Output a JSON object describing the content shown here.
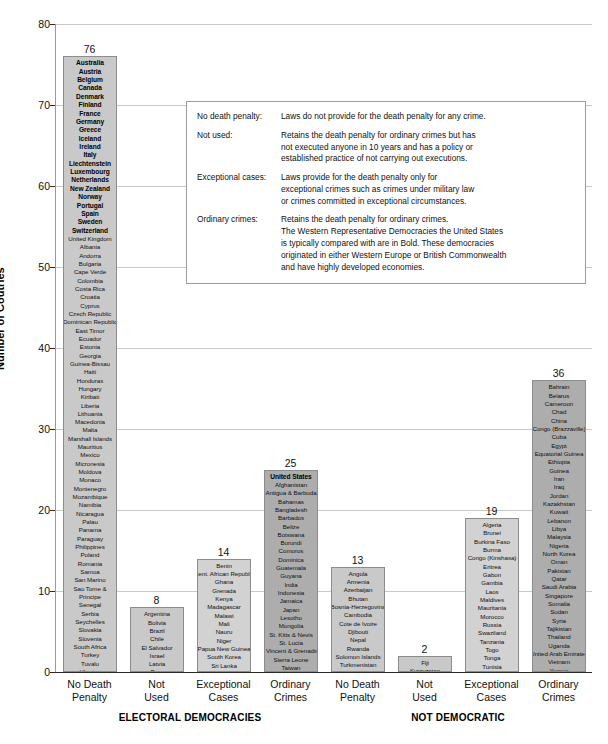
{
  "chart_data": {
    "type": "bar",
    "title": "",
    "xlabel": "",
    "ylabel": "Number of Coutries",
    "ylim": [
      0,
      80
    ],
    "ytick_step": 10,
    "yticks": [
      "0",
      "10",
      "20",
      "30",
      "40",
      "50",
      "60",
      "70",
      "80"
    ],
    "grid": true,
    "legend_position": "inside-upper-right",
    "groups": [
      {
        "name": "ELECTORAL DEMOCRACIES",
        "bars": [
          0,
          1,
          2,
          3
        ]
      },
      {
        "name": "NOT DEMOCRATIC",
        "bars": [
          4,
          5,
          6,
          7
        ]
      }
    ],
    "categories": [
      "No Death Penalty",
      "Not Used",
      "Exceptional Cases",
      "Ordinary Crimes",
      "No Death Penalty",
      "Not Used",
      "Exceptional Cases",
      "Ordinary Crimes"
    ],
    "values": [
      76,
      8,
      14,
      25,
      13,
      2,
      19,
      36
    ],
    "bars": [
      {
        "label_line1": "No Death",
        "label_line2": "Penalty",
        "value": 76,
        "shade": "#c9c9c9",
        "bold_count": 21,
        "countries": [
          "Australia",
          "Austria",
          "Belgium",
          "Canada",
          "Denmark",
          "Finland",
          "France",
          "Germany",
          "Greece",
          "Iceland",
          "Ireland",
          "Italy",
          "Liechtenstein",
          "Luxembourg",
          "Netherlands",
          "New Zealand",
          "Norway",
          "Portugal",
          "Spain",
          "Sweden",
          "Switzerland",
          "United Kingdom",
          "Albania",
          "Andorra",
          "Bulgaria",
          "Cape Verde",
          "Colombia",
          "Costa Rica",
          "Croatia",
          "Cyprus",
          "Czech Republic",
          "Dominican Republic",
          "East Timor",
          "Ecuador",
          "Estonia",
          "Georgia",
          "Guinea-Bissau",
          "Haiti",
          "Honduras",
          "Hungary",
          "Kiribati",
          "Liberia",
          "Lithuania",
          "Macedonia",
          "Malta",
          "Marshall Islands",
          "Mauritius",
          "Mexico",
          "Micronesia",
          "Moldova",
          "Monaco",
          "Montenegro",
          "Mozambique",
          "Namibia",
          "Nicaragua",
          "Palau",
          "Panama",
          "Paraguay",
          "Philippines",
          "Poland",
          "Romania",
          "Samoa",
          "San Marino",
          "Sao Tome &",
          "Principe",
          "Senegal",
          "Serbia",
          "Seychelles",
          "Slovakia",
          "Slovenia",
          "South Africa",
          "Turkey",
          "Tuvalu",
          "Ukraine",
          "Uruguay",
          "Vanuatu",
          "Venezuela"
        ]
      },
      {
        "label_line1": "Not",
        "label_line2": "Used",
        "value": 8,
        "shade": "#c9c9c9",
        "bold_count": 0,
        "countries": [
          "Argentina",
          "Bolivia",
          "Brazil",
          "Chile",
          "El Salvador",
          "Israel",
          "Latvia",
          "Peru"
        ]
      },
      {
        "label_line1": "Exceptional",
        "label_line2": "Cases",
        "value": 14,
        "shade": "#d2d2d2",
        "bold_count": 0,
        "countries": [
          "Benin",
          "Cent. African Republic",
          "Ghana",
          "Grenada",
          "Kenya",
          "Madagascar",
          "Malawi",
          "Mali",
          "Nauru",
          "Niger",
          "Papua New Guinea",
          "South Korea",
          "Sri Lanka",
          "Suriname"
        ]
      },
      {
        "label_line1": "Ordinary",
        "label_line2": "Crimes",
        "value": 25,
        "shade": "#adadad",
        "bold_count": 1,
        "countries": [
          "United States",
          "Afghanistan",
          "Antigua & Barbuda",
          "Bahamas",
          "Bangladesh",
          "Barbados",
          "Belize",
          "Botswana",
          "Burundi",
          "Comoros",
          "Dominica",
          "Guatemala",
          "Guyana",
          "India",
          "Indonesia",
          "Jamaica",
          "Japan",
          "Lesotho",
          "Mongolia",
          "St. Kitts & Nevis",
          "St. Lucia",
          "St. Vincent & Grenadines",
          "Sierra Leone",
          "Taiwan",
          "Trinidad & Tobago"
        ]
      },
      {
        "label_line1": "No Death",
        "label_line2": "Penalty",
        "value": 13,
        "shade": "#c9c9c9",
        "bold_count": 0,
        "countries": [
          "Angola",
          "Armenia",
          "Azerbaijan",
          "Bhutan",
          "Bosnia-Herzegovina",
          "Cambodia",
          "Cote de Ivoire",
          "Djibouti",
          "Nepal",
          "Rwanda",
          "Solomon Islands",
          "Turkmenistan",
          "Uzbekistan"
        ]
      },
      {
        "label_line1": "Not",
        "label_line2": "Used",
        "value": 2,
        "shade": "#c9c9c9",
        "bold_count": 0,
        "countries": [
          "Fiji",
          "Kyrgyzstan"
        ]
      },
      {
        "label_line1": "Exceptional",
        "label_line2": "Cases",
        "value": 19,
        "shade": "#d2d2d2",
        "bold_count": 0,
        "countries": [
          "Algeria",
          "Brunei",
          "Burkina Faso",
          "Burma",
          "Congo (Kinshasa)",
          "Eritrea",
          "Gabon",
          "Gambia",
          "Laos",
          "Maldives",
          "Mauritania",
          "Morocco",
          "Russia",
          "Swaziland",
          "Tanzania",
          "Togo",
          "Tonga",
          "Tunisia",
          "Zambia"
        ]
      },
      {
        "label_line1": "Ordinary",
        "label_line2": "Crimes",
        "value": 36,
        "shade": "#adadad",
        "bold_count": 0,
        "countries": [
          "Bahrain",
          "Belarus",
          "Cameroon",
          "Chad",
          "China",
          "Congo (Brazzaville)",
          "Cuba",
          "Egypt",
          "Equatorial Guinea",
          "Ethiopia",
          "Guinea",
          "Iran",
          "Iraq",
          "Jordan",
          "Kazakhstan",
          "Kuwait",
          "Lebanon",
          "Libya",
          "Malaysia",
          "Nigeria",
          "North Korea",
          "Oman",
          "Pakistan",
          "Qatar",
          "Saudi Arabia",
          "Singapore",
          "Somalia",
          "Sudan",
          "Syria",
          "Tajikistan",
          "Thailand",
          "Uganda",
          "United Arab Emirates",
          "Vietnam",
          "Yemen",
          "Zimbabwe"
        ]
      }
    ]
  },
  "legend": {
    "rows": [
      {
        "term": "No death penalty:",
        "lines": [
          "Laws do not provide for the death penalty for any crime."
        ]
      },
      {
        "term": "Not used:",
        "lines": [
          "Retains the death penalty for ordinary crimes but has",
          "not executed anyone in 10 years and has a policy or",
          "established practice of not carrying out executions."
        ]
      },
      {
        "term": "Exceptional cases:",
        "lines": [
          "Laws provide for the death penalty only for",
          "exceptional crimes such as crimes under military law",
          "or crimes committed in exceptional circumstances."
        ]
      },
      {
        "term": "Ordinary crimes:",
        "lines": [
          "Retains the death penalty for ordinary crimes.",
          "The Western Representative Democracies the United States",
          "is typically compared with are in Bold. These democracies",
          "originated in either Western Europe or British Commonwealth",
          "and have highly developed economies."
        ]
      }
    ]
  },
  "colors": {
    "gridline": "#c8c8c8",
    "axis": "#2b2b2b",
    "bar_light": "#c9c9c9",
    "bar_mid": "#d2d2d2",
    "bar_dark": "#adadad"
  }
}
